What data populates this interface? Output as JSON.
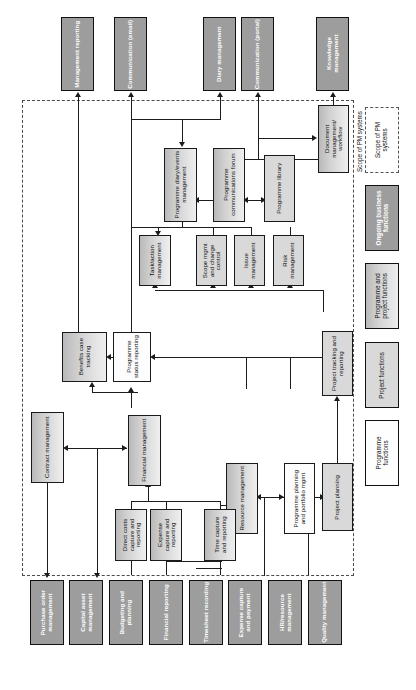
{
  "figure": {
    "orientation": "rotated-90",
    "scope_frame_label": "Scope of PM systems"
  },
  "legend": {
    "items": [
      {
        "label": "Scope of PM systems",
        "style": "dashed-outline",
        "color": "#ffffff"
      },
      {
        "label": "Ongoing business functions",
        "style": "solid-dark",
        "color": "#9d9d9d"
      },
      {
        "label": "Programme and project functions",
        "style": "gradient-grey",
        "color": "#d4d4d4"
      },
      {
        "label": "Project functions",
        "style": "light-grey",
        "color": "#d9d9d9"
      },
      {
        "label": "Programme functions",
        "style": "white",
        "color": "#fefefe"
      }
    ]
  },
  "nodes": {
    "outputs": [
      {
        "id": "management-reporting",
        "label": "Management reporting",
        "type": "ongoing"
      },
      {
        "id": "communication-email",
        "label": "Communication (email)",
        "type": "ongoing"
      },
      {
        "id": "diary-management",
        "label": "Diary management",
        "type": "ongoing"
      },
      {
        "id": "communication-portal",
        "label": "Communication (portal)",
        "type": "ongoing"
      },
      {
        "id": "knowledge-management",
        "label": "Knowledge management",
        "type": "ongoing"
      }
    ],
    "inputs": [
      {
        "id": "purchase-order-management",
        "label": "Purchase order management",
        "type": "ongoing"
      },
      {
        "id": "capital-asset-management",
        "label": "Capital asset management",
        "type": "ongoing"
      },
      {
        "id": "budgeting-and-planning",
        "label": "Budgeting and planning",
        "type": "ongoing"
      },
      {
        "id": "financial-reporting",
        "label": "Financial reporting",
        "type": "ongoing"
      },
      {
        "id": "timesheet-recording",
        "label": "Timesheet recording",
        "type": "ongoing"
      },
      {
        "id": "expense-capture-and-payment",
        "label": "Expense capture and payment",
        "type": "ongoing"
      },
      {
        "id": "hr-resource-management",
        "label": "HR/resource management",
        "type": "ongoing"
      },
      {
        "id": "quality-management",
        "label": "Quality management",
        "type": "ongoing"
      }
    ],
    "core": [
      {
        "id": "programme-diary-events-management",
        "label": "Programme diary/events management",
        "type": "programme-and-project"
      },
      {
        "id": "programme-communications-forum",
        "label": "Programme communications forum",
        "type": "programme-and-project"
      },
      {
        "id": "programme-library",
        "label": "Programme library",
        "type": "project"
      },
      {
        "id": "document-management-workflow",
        "label": "Document management/ workflow",
        "type": "programme-and-project"
      },
      {
        "id": "task-action-management",
        "label": "Task/action management",
        "type": "programme-and-project"
      },
      {
        "id": "scope-mgmt-and-change-control",
        "label": "Scope mgmt and change control",
        "type": "project"
      },
      {
        "id": "issue-management",
        "label": "Issue management",
        "type": "project"
      },
      {
        "id": "risk-management",
        "label": "Risk management",
        "type": "project"
      },
      {
        "id": "benefits-case-tracking",
        "label": "Benefits case tracking",
        "type": "programme-and-project"
      },
      {
        "id": "programme-status-reporting",
        "label": "Programme status reporting",
        "type": "programme"
      },
      {
        "id": "project-tracking-and-reporting",
        "label": "Project tracking and reporting",
        "type": "project"
      },
      {
        "id": "contract-management",
        "label": "Contract management",
        "type": "programme-and-project"
      },
      {
        "id": "financial-management",
        "label": "Financial management",
        "type": "programme-and-project"
      },
      {
        "id": "direct-costs-capture-and-reporting",
        "label": "Direct costs capture and reporting",
        "type": "programme-and-project"
      },
      {
        "id": "expense-capture-and-reporting",
        "label": "Expense capture and reporting",
        "type": "programme-and-project"
      },
      {
        "id": "time-capture-and-reporting",
        "label": "Time capture and reporting",
        "type": "programme-and-project"
      },
      {
        "id": "resource-management",
        "label": "Resource management",
        "type": "programme-and-project"
      },
      {
        "id": "programme-planning-and-portfolio-mgmt",
        "label": "Programme planning and portfolio mgmt",
        "type": "programme"
      },
      {
        "id": "project-planning",
        "label": "Project planning",
        "type": "project"
      }
    ]
  }
}
